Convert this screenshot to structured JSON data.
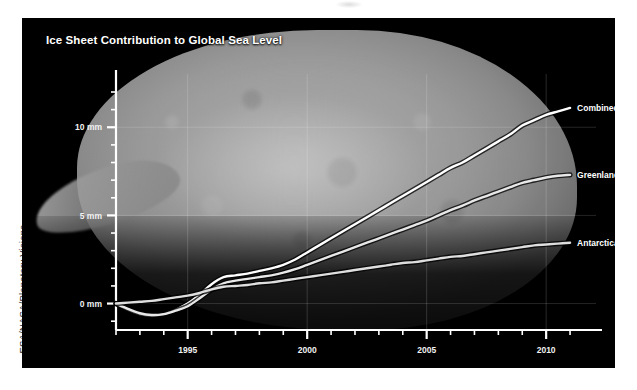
{
  "credit": "ESA/NASA/Planetary Visions",
  "chart_data": {
    "type": "line",
    "title": "Ice Sheet Contribution to Global Sea Level",
    "xlabel": "",
    "ylabel": "",
    "xlim": [
      1992,
      2011.5
    ],
    "ylim": [
      -1.5,
      12
    ],
    "grid": true,
    "legend_position": "inline-right",
    "y_ticks": [
      0,
      5,
      10
    ],
    "y_tick_labels": [
      "0 mm",
      "5 mm",
      "10 mm"
    ],
    "y_minor_step": 1,
    "x_ticks": [
      1995,
      2000,
      2005,
      2010
    ],
    "x_tick_labels": [
      "1995",
      "2000",
      "2005",
      "2010"
    ],
    "x_minor_step": 1,
    "series": [
      {
        "name": "Combined",
        "color": "#ffffff",
        "label": "Combined",
        "x": [
          1992.0,
          1992.5,
          1993.0,
          1993.5,
          1994.0,
          1994.5,
          1995.0,
          1995.5,
          1996.0,
          1996.5,
          1997.0,
          1997.5,
          1998.0,
          1998.5,
          1999.0,
          1999.5,
          2000.0,
          2000.5,
          2001.0,
          2001.5,
          2002.0,
          2002.5,
          2003.0,
          2003.5,
          2004.0,
          2004.5,
          2005.0,
          2005.5,
          2006.0,
          2006.5,
          2007.0,
          2007.5,
          2008.0,
          2008.5,
          2009.0,
          2009.5,
          2010.0,
          2010.5,
          2011.0
        ],
        "y": [
          0.0,
          -0.35,
          -0.6,
          -0.7,
          -0.6,
          -0.35,
          0.0,
          0.5,
          1.1,
          1.5,
          1.6,
          1.7,
          1.85,
          2.0,
          2.2,
          2.5,
          2.9,
          3.3,
          3.7,
          4.1,
          4.5,
          4.9,
          5.3,
          5.7,
          6.1,
          6.5,
          6.9,
          7.3,
          7.7,
          8.0,
          8.4,
          8.8,
          9.2,
          9.6,
          10.1,
          10.4,
          10.7,
          10.9,
          11.1
        ]
      },
      {
        "name": "Greenland",
        "color": "#e8e8e8",
        "label": "Greenland",
        "x": [
          1992.0,
          1992.5,
          1993.0,
          1993.5,
          1994.0,
          1994.5,
          1995.0,
          1995.5,
          1996.0,
          1996.5,
          1997.0,
          1997.5,
          1998.0,
          1998.5,
          1999.0,
          1999.5,
          2000.0,
          2000.5,
          2001.0,
          2001.5,
          2002.0,
          2002.5,
          2003.0,
          2003.5,
          2004.0,
          2004.5,
          2005.0,
          2005.5,
          2006.0,
          2006.5,
          2007.0,
          2007.5,
          2008.0,
          2008.5,
          2009.0,
          2009.5,
          2010.0,
          2010.5,
          2011.0
        ],
        "y": [
          0.0,
          -0.3,
          -0.55,
          -0.65,
          -0.6,
          -0.4,
          -0.15,
          0.3,
          0.8,
          1.15,
          1.3,
          1.4,
          1.5,
          1.6,
          1.75,
          1.95,
          2.2,
          2.45,
          2.7,
          2.95,
          3.2,
          3.45,
          3.7,
          3.95,
          4.2,
          4.45,
          4.7,
          5.0,
          5.3,
          5.55,
          5.85,
          6.1,
          6.35,
          6.6,
          6.85,
          7.0,
          7.15,
          7.25,
          7.3
        ]
      },
      {
        "name": "Antarctica",
        "color": "#dedede",
        "label": "Antarctica",
        "x": [
          1992.0,
          1992.5,
          1993.0,
          1993.5,
          1994.0,
          1994.5,
          1995.0,
          1995.5,
          1996.0,
          1996.5,
          1997.0,
          1997.5,
          1998.0,
          1998.5,
          1999.0,
          1999.5,
          2000.0,
          2000.5,
          2001.0,
          2001.5,
          2002.0,
          2002.5,
          2003.0,
          2003.5,
          2004.0,
          2004.5,
          2005.0,
          2005.5,
          2006.0,
          2006.5,
          2007.0,
          2007.5,
          2008.0,
          2008.5,
          2009.0,
          2009.5,
          2010.0,
          2010.5,
          2011.0
        ],
        "y": [
          0.0,
          0.05,
          0.1,
          0.15,
          0.25,
          0.35,
          0.45,
          0.6,
          0.8,
          0.95,
          1.0,
          1.05,
          1.15,
          1.2,
          1.3,
          1.4,
          1.5,
          1.6,
          1.7,
          1.8,
          1.9,
          2.0,
          2.1,
          2.2,
          2.3,
          2.35,
          2.45,
          2.55,
          2.65,
          2.7,
          2.8,
          2.9,
          3.0,
          3.1,
          3.2,
          3.3,
          3.35,
          3.4,
          3.45
        ]
      }
    ]
  }
}
